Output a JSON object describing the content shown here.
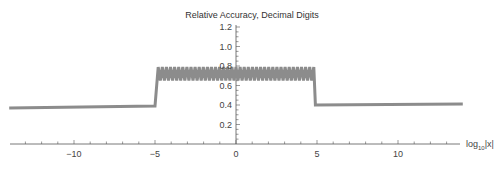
{
  "chart_data": {
    "type": "line",
    "title": "Relative Accuracy, Decimal Digits",
    "xlabel": "log10|x|",
    "xlabel_parts": {
      "base": "log",
      "sub": "10",
      "suffix": "|x|"
    },
    "ylabel": "",
    "xlim": [
      -14.3,
      14.0
    ],
    "ylim": [
      0,
      1.2
    ],
    "xticks_major": [
      -10,
      -5,
      0,
      5,
      10
    ],
    "xtick_labels": [
      "−10",
      "−5",
      "0",
      "5",
      "10"
    ],
    "yticks_major": [
      0.2,
      0.4,
      0.6,
      0.8,
      1.0,
      1.2
    ],
    "ytick_labels": [
      "0.2",
      "0.4",
      "0.6",
      "0.8",
      "1.0",
      "1.2"
    ],
    "grid": false,
    "legend": null,
    "line_color": "#8c8c8c",
    "segments": [
      {
        "name": "left-flat",
        "x": [
          -14.0,
          -5.0
        ],
        "y": [
          0.37,
          0.39
        ]
      },
      {
        "name": "oscillating-plateau",
        "x": [
          -4.8,
          4.8
        ],
        "y_min": 0.65,
        "y_max": 0.79,
        "oscillations": 38
      },
      {
        "name": "right-flat",
        "x": [
          4.9,
          14.0
        ],
        "y": [
          0.4,
          0.41
        ]
      }
    ],
    "steps": [
      {
        "x": -5.0,
        "from": 0.39,
        "to": 0.79
      },
      {
        "x": 4.9,
        "from": 0.79,
        "to": 0.4
      }
    ]
  }
}
